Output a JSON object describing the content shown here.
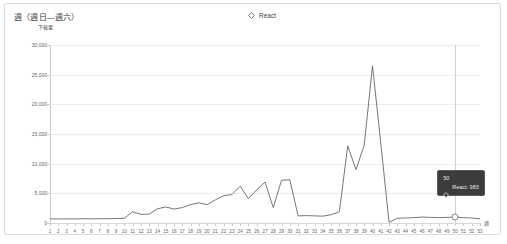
{
  "card": {
    "title": "週（週日—週六）"
  },
  "legend": {
    "items": [
      {
        "label": "React",
        "color": "#666666",
        "marker": "diamond-outline-icon"
      }
    ]
  },
  "tooltip": {
    "header": "50",
    "series_label": "React: 983",
    "background": "#3c3c3c",
    "marker": "diamond-outline-icon"
  },
  "axis": {
    "y_unit_label": "下載量",
    "x_unit_label": "週"
  },
  "chart_data": {
    "type": "line",
    "title": "週（週日—週六）",
    "xlabel": "週",
    "ylabel": "下載量",
    "ylim": [
      0,
      30000
    ],
    "yticks": [
      0,
      5000,
      10000,
      15000,
      20000,
      25000,
      30000
    ],
    "ytick_labels": [
      "0",
      "5,000",
      "10,000",
      "15,000",
      "20,000",
      "25,000",
      "30,000"
    ],
    "grid": true,
    "legend_position": "top-center",
    "line_color": "#666666",
    "categories": [
      1,
      2,
      3,
      4,
      5,
      6,
      7,
      8,
      9,
      10,
      11,
      12,
      13,
      14,
      15,
      16,
      17,
      18,
      19,
      20,
      21,
      22,
      23,
      24,
      25,
      26,
      27,
      28,
      29,
      30,
      31,
      32,
      33,
      34,
      35,
      36,
      37,
      38,
      39,
      40,
      41,
      42,
      43,
      44,
      45,
      46,
      47,
      48,
      49,
      50,
      51,
      52,
      53
    ],
    "series": [
      {
        "name": "React",
        "color": "#666666",
        "values": [
          700,
          680,
          700,
          690,
          720,
          700,
          720,
          730,
          750,
          800,
          1900,
          1450,
          1500,
          2400,
          2700,
          2350,
          2600,
          3100,
          3400,
          3100,
          3900,
          4600,
          4800,
          6200,
          4100,
          5600,
          6900,
          2600,
          7200,
          7300,
          1200,
          1250,
          1200,
          1150,
          1400,
          1900,
          13000,
          9000,
          13100,
          26500,
          13500,
          100,
          800,
          850,
          900,
          1000,
          950,
          900,
          950,
          983,
          900,
          850,
          700
        ]
      }
    ],
    "highlight": {
      "category": 50,
      "value": 983
    }
  }
}
